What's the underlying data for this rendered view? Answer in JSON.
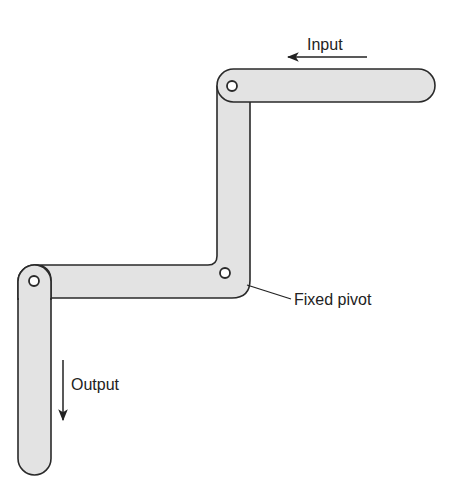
{
  "diagram": {
    "title": "",
    "type": "linkage mechanism",
    "labels": {
      "input": "Input",
      "output": "Output",
      "fixed_pivot": "Fixed pivot"
    },
    "colors": {
      "link_fill": "#e3e3e3",
      "outline": "#2a2a2a",
      "text": "#222222",
      "background": "#ffffff"
    },
    "components": [
      {
        "name": "input-link",
        "orientation": "horizontal"
      },
      {
        "name": "bell-crank",
        "shape": "L",
        "pivot": "fixed"
      },
      {
        "name": "output-link",
        "orientation": "vertical"
      }
    ]
  }
}
